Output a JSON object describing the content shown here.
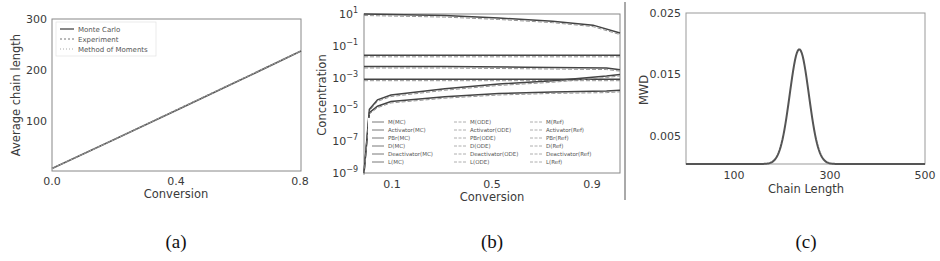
{
  "chart_data": [
    {
      "id": "a",
      "type": "line",
      "caption": "(a)",
      "title": "",
      "xlabel": "Conversion",
      "ylabel": "Average chain length",
      "xlim": [
        0.0,
        0.8
      ],
      "ylim": [
        0,
        300
      ],
      "xticks": [
        "0.0",
        "0.4",
        "0.8"
      ],
      "yticks": [
        "100",
        "200",
        "300"
      ],
      "grid": false,
      "legend_position": "upper left",
      "series": [
        {
          "name": "Monte Carlo",
          "style": "solid",
          "x": [
            0.0,
            0.2,
            0.4,
            0.6,
            0.8
          ],
          "y": [
            5,
            62,
            120,
            178,
            237
          ]
        },
        {
          "name": "Experiment",
          "style": "dashed",
          "x": [
            0.0,
            0.2,
            0.4,
            0.6,
            0.8
          ],
          "y": [
            5,
            62,
            121,
            179,
            237
          ]
        },
        {
          "name": "Method of Moments",
          "style": "dotted",
          "x": [
            0.0,
            0.2,
            0.4,
            0.6,
            0.8
          ],
          "y": [
            5,
            62,
            120,
            178,
            237
          ]
        }
      ]
    },
    {
      "id": "b",
      "type": "line",
      "caption": "(b)",
      "title": "",
      "xlabel": "Conversion",
      "ylabel": "Concentration",
      "yscale": "log",
      "xlim": [
        0.0,
        0.95
      ],
      "ylim": [
        "1e-9",
        "1e1"
      ],
      "xticks": [
        "0.1",
        "0.5",
        "0.9"
      ],
      "yticks": [
        "10^1",
        "10^-1",
        "10^-3",
        "10^-5",
        "10^-7",
        "10^-9"
      ],
      "grid": false,
      "legend_position": "lower center, 3 columns",
      "legend": [
        "M(MC)",
        "Activator(MC)",
        "PBr(MC)",
        "D(MC)",
        "Deactivator(MC)",
        "L(MC)",
        "M(ODE)",
        "Activator(ODE)",
        "PBr(ODE)",
        "D(ODE)",
        "Deactivator(ODE)",
        "L(ODE)",
        "M(Ref)",
        "Activator(Ref)",
        "PBr(Ref)",
        "D(Ref)",
        "Deactivator(Ref)",
        "L(Ref)"
      ],
      "series": [
        {
          "name": "M",
          "x": [
            0.0,
            0.3,
            0.5,
            0.7,
            0.85,
            0.95
          ],
          "log10y": [
            1.0,
            0.9,
            0.75,
            0.55,
            0.3,
            -0.2
          ]
        },
        {
          "name": "Activator",
          "x": [
            0.0,
            0.95
          ],
          "log10y": [
            -1.6,
            -1.6
          ]
        },
        {
          "name": "PBr",
          "x": [
            0.0,
            0.3,
            0.6,
            0.9,
            0.95
          ],
          "log10y": [
            -2.3,
            -2.3,
            -2.35,
            -2.4,
            -2.5
          ]
        },
        {
          "name": "Deactivator",
          "x": [
            0.0,
            0.95
          ],
          "log10y": [
            -3.1,
            -3.1
          ]
        },
        {
          "name": "D",
          "x": [
            0.0,
            0.02,
            0.05,
            0.1,
            0.3,
            0.5,
            0.7,
            0.9,
            0.95
          ],
          "log10y": [
            -9.0,
            -5.0,
            -4.4,
            -4.1,
            -3.7,
            -3.4,
            -3.2,
            -2.9,
            -2.8
          ]
        },
        {
          "name": "L",
          "x": [
            0.0,
            0.02,
            0.05,
            0.1,
            0.3,
            0.5,
            0.7,
            0.9,
            0.95
          ],
          "log10y": [
            -9.0,
            -5.2,
            -4.8,
            -4.5,
            -4.2,
            -4.0,
            -3.9,
            -3.85,
            -3.8
          ]
        }
      ]
    },
    {
      "id": "c",
      "type": "line",
      "caption": "(c)",
      "title": "",
      "xlabel": "Chain Length",
      "ylabel": "MWD",
      "xlim": [
        0,
        500
      ],
      "ylim": [
        0,
        0.025
      ],
      "xticks": [
        "100",
        "300",
        "500"
      ],
      "yticks": [
        "0.005",
        "0.015",
        "0.025"
      ],
      "grid": false,
      "series": [
        {
          "name": "MWD",
          "peak_x": 237,
          "peak_y": 0.019,
          "std": 20,
          "x": [
            0,
            150,
            180,
            200,
            215,
            225,
            237,
            250,
            260,
            275,
            295,
            320,
            500
          ],
          "y": [
            0.0,
            0.0002,
            0.0012,
            0.0055,
            0.011,
            0.0165,
            0.019,
            0.0165,
            0.012,
            0.0055,
            0.0009,
            0.0001,
            0.0
          ]
        }
      ]
    }
  ],
  "colors": {
    "line": "#555555",
    "axis": "#888888",
    "text": "#3a3a3a"
  }
}
